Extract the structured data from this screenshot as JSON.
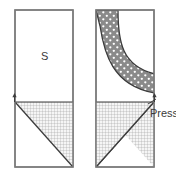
{
  "figure": {
    "type": "technical-cross-section-diagram",
    "width": 176,
    "height": 180,
    "background_color": "#ffffff"
  },
  "labels": {
    "material_label": "S",
    "press_label": "Press"
  },
  "colors": {
    "outline": "#7a7a7a",
    "dark_outline": "#3c3c3c",
    "band_fill": "#8a8a8a",
    "band_dot": "#ffffff",
    "hatch_line": "#9a9a9a",
    "hatch_background": "#f4f4f4",
    "text": "#3a3a3a"
  },
  "panels": [
    {
      "name": "left-panel",
      "x": 15,
      "y": 10,
      "width": 58,
      "height": 157,
      "divider_y": 102,
      "label": "S",
      "has_dotted_band": false,
      "has_hatched_triangle": true,
      "marker_side": "left"
    },
    {
      "name": "right-panel",
      "x": 96,
      "y": 10,
      "width": 58,
      "height": 157,
      "divider_y": 102,
      "label": "",
      "has_dotted_band": true,
      "has_hatched_triangle": true,
      "marker_side": "right"
    }
  ],
  "regions": {
    "dotted_band": {
      "name": "curved-dotted-band",
      "description": "curved gray band with white dots sweeping from top-left corner toward right edge",
      "fill": "#8a8a8a",
      "dot_fill": "#ffffff"
    },
    "hatched_triangle": {
      "name": "crosshatched-triangle",
      "description": "grid-hatched right triangle below divider, hypotenuse from upper-left to lower-right",
      "hatch_spacing": 3
    }
  },
  "markers": [
    {
      "name": "left-level-marker",
      "x": 15,
      "y": 102,
      "direction": "up"
    },
    {
      "name": "right-level-marker",
      "x": 154,
      "y": 102,
      "direction": "up"
    }
  ]
}
